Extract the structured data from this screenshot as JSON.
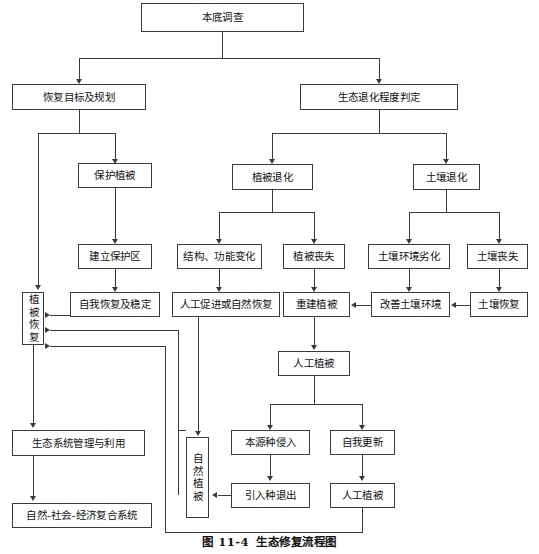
{
  "figure": {
    "caption_number": "图 11-4",
    "caption_title": "生态修复流程图"
  },
  "diagram": {
    "type": "flowchart",
    "orientation": "top-down",
    "nodes": [
      {
        "id": "n1",
        "label": "本底调查",
        "level": 0
      },
      {
        "id": "n2",
        "label": "恢复目标及规划",
        "level": 1
      },
      {
        "id": "n3",
        "label": "生态退化程度判定",
        "level": 1
      },
      {
        "id": "n4",
        "label": "保护植被",
        "level": 2
      },
      {
        "id": "n5",
        "label": "植被退化",
        "level": 2
      },
      {
        "id": "n6",
        "label": "土壤退化",
        "level": 2
      },
      {
        "id": "n7",
        "label": "建立保护区",
        "level": 3
      },
      {
        "id": "n8",
        "label": "结构、功能变化",
        "level": 3
      },
      {
        "id": "n9",
        "label": "植被丧失",
        "level": 3
      },
      {
        "id": "n10",
        "label": "土壤环境劣化",
        "level": 3
      },
      {
        "id": "n11",
        "label": "土壤丧失",
        "level": 3
      },
      {
        "id": "n12",
        "label": "植被恢复",
        "level": 4,
        "vertical": true
      },
      {
        "id": "n13",
        "label": "自我恢复及稳定",
        "level": 4
      },
      {
        "id": "n14",
        "label": "人工促进或自然恢复",
        "level": 4
      },
      {
        "id": "n15",
        "label": "重建植被",
        "level": 4
      },
      {
        "id": "n16",
        "label": "改善土壤环境",
        "level": 4
      },
      {
        "id": "n17",
        "label": "土壤恢复",
        "level": 4
      },
      {
        "id": "n18",
        "label": "人工植被",
        "level": 5
      },
      {
        "id": "n19",
        "label": "本源种侵入",
        "level": 6
      },
      {
        "id": "n20",
        "label": "自我更新",
        "level": 6
      },
      {
        "id": "n21",
        "label": "自然植被",
        "level": 6,
        "vertical": true
      },
      {
        "id": "n22",
        "label": "引入种退出",
        "level": 7
      },
      {
        "id": "n23",
        "label": "人工植被",
        "level": 7
      },
      {
        "id": "n24",
        "label": "生态系统管理与利用",
        "level": 8
      },
      {
        "id": "n25",
        "label": "自然-社会-经济复合系统",
        "level": 9
      }
    ],
    "edges": [
      {
        "from": "n1",
        "to": "n2"
      },
      {
        "from": "n1",
        "to": "n3"
      },
      {
        "from": "n2",
        "to": "n4"
      },
      {
        "from": "n2",
        "to": "n12"
      },
      {
        "from": "n3",
        "to": "n5"
      },
      {
        "from": "n3",
        "to": "n6"
      },
      {
        "from": "n4",
        "to": "n7"
      },
      {
        "from": "n5",
        "to": "n8"
      },
      {
        "from": "n5",
        "to": "n9"
      },
      {
        "from": "n6",
        "to": "n10"
      },
      {
        "from": "n6",
        "to": "n11"
      },
      {
        "from": "n7",
        "to": "n13"
      },
      {
        "from": "n8",
        "to": "n14"
      },
      {
        "from": "n9",
        "to": "n15"
      },
      {
        "from": "n10",
        "to": "n16"
      },
      {
        "from": "n11",
        "to": "n17"
      },
      {
        "from": "n17",
        "to": "n16",
        "dir": "left"
      },
      {
        "from": "n16",
        "to": "n15",
        "dir": "left"
      },
      {
        "from": "n13",
        "to": "n12",
        "dir": "left"
      },
      {
        "from": "n14",
        "to": "n21"
      },
      {
        "from": "n15",
        "to": "n18"
      },
      {
        "from": "n18",
        "to": "n19"
      },
      {
        "from": "n18",
        "to": "n20"
      },
      {
        "from": "n19",
        "to": "n22"
      },
      {
        "from": "n20",
        "to": "n23"
      },
      {
        "from": "n22",
        "to": "n21",
        "dir": "left"
      },
      {
        "from": "n23",
        "to": "n12"
      },
      {
        "from": "n21",
        "to": "n12"
      },
      {
        "from": "n12",
        "to": "n24"
      },
      {
        "from": "n24",
        "to": "n25"
      }
    ]
  }
}
